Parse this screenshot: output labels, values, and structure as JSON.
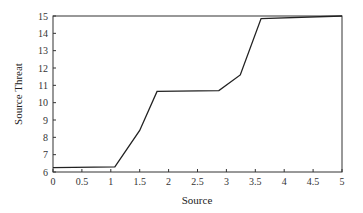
{
  "chart_data": {
    "type": "line",
    "title": "",
    "xlabel": "Source",
    "ylabel": "Source Threat",
    "xlim": [
      0,
      5
    ],
    "ylim": [
      6,
      15
    ],
    "grid": false,
    "legend": null,
    "xticks": [
      0,
      0.5,
      1,
      1.5,
      2,
      2.5,
      3,
      3.5,
      4,
      4.5,
      5
    ],
    "xtick_labels": [
      "0",
      "0.5",
      "1",
      "1.5",
      "2",
      "2.5",
      "3",
      "3.5",
      "4",
      "4.5",
      "5"
    ],
    "yticks": [
      6,
      7,
      8,
      9,
      10,
      11,
      12,
      13,
      14,
      15
    ],
    "ytick_labels": [
      "6",
      "7",
      "8",
      "9",
      "10",
      "11",
      "12",
      "13",
      "14",
      "15"
    ],
    "series": [
      {
        "name": "Source Threat",
        "color": "#222222",
        "x": [
          0,
          1.07,
          1.5,
          1.8,
          2.87,
          3.24,
          3.6,
          5.0
        ],
        "y": [
          6.25,
          6.3,
          8.4,
          10.65,
          10.7,
          11.6,
          14.85,
          15.0
        ]
      }
    ]
  }
}
